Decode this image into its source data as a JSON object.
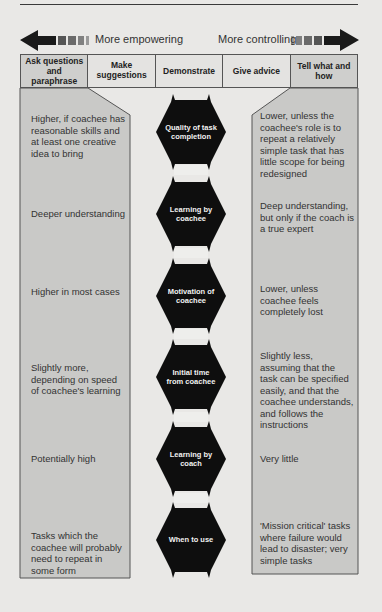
{
  "arrow_row": {
    "left_label": "More empowering",
    "right_label": "More controlling",
    "left_icon": "arrow-left-icon",
    "right_icon": "arrow-right-icon"
  },
  "header": {
    "columns": [
      {
        "label": "Ask questions and paraphrase"
      },
      {
        "label": "Make suggestions"
      },
      {
        "label": "Demonstrate"
      },
      {
        "label": "Give advice"
      },
      {
        "label": "Tell what and how"
      }
    ]
  },
  "criteria": [
    {
      "label": "Quality of task completion",
      "left": "Higher, if coachee has reasonable skills and at least one creative idea to bring",
      "right": "Lower, unless the coachee's role is to repeat a relatively simple task that has little scope for being redesigned"
    },
    {
      "label": "Learning by coachee",
      "left": "Deeper understanding",
      "right": "Deep understanding, but only if the coach is a true expert"
    },
    {
      "label": "Motivation of coachee",
      "left": "Higher in most cases",
      "right": "Lower, unless coachee feels completely lost"
    },
    {
      "label": "Initial time from coachee",
      "left": "Slightly more, depending on speed of coachee's learning",
      "right": "Slightly less, assuming that the task can be specified easily, and that the coachee understands, and follows the instructions"
    },
    {
      "label": "Learning by coach",
      "left": "Potentially high",
      "right": "Very little"
    },
    {
      "label": "When to use",
      "left": "Tasks which the coachee will probably need to repeat in some form",
      "right": "'Mission critical' tasks where failure would lead to disaster; very simple tasks"
    }
  ],
  "colors": {
    "background": "#e9e8e6",
    "panel": "#c9c9c7",
    "hexagon": "#0e0e0e",
    "border": "#555555"
  }
}
